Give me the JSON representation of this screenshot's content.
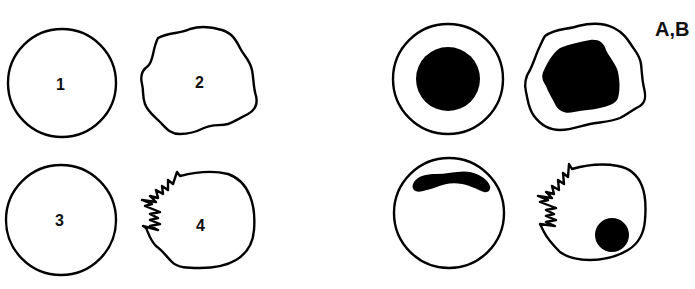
{
  "figure": {
    "panel_label": "A,B",
    "panel_a": {
      "cells": [
        {
          "label": "1",
          "shape": "round smooth outline"
        },
        {
          "label": "2",
          "shape": "wavy irregular outline"
        },
        {
          "label": "3",
          "shape": "round smooth outline"
        },
        {
          "label": "4",
          "shape": "irregular outline with jagged zigzag edge"
        }
      ]
    },
    "panel_b": {
      "cells": [
        {
          "shape": "round cell with large round central nucleus"
        },
        {
          "shape": "wavy cell with large irregular dark nucleus"
        },
        {
          "shape": "round cell with crescent nucleus at top"
        },
        {
          "shape": "jagged-edge cell with small round nucleus at lower right"
        }
      ]
    },
    "colors": {
      "stroke": "#000000",
      "fill": "#000000",
      "background": "#ffffff"
    }
  }
}
